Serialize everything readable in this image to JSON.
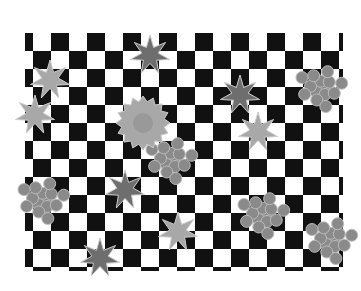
{
  "image": {
    "description": "Grayscale photo of a fabric swatch with black-and-white checkerboard pattern overlaid with maple leaves, chrysanthemums and grape-cluster flowers",
    "colors": {
      "background": "#ffffff",
      "check_dark": "#111111",
      "motif_light": "#a8a8a8",
      "motif_mid": "#8a8a8a",
      "motif_dark": "#6e6e6e"
    },
    "motifs": {
      "maple_leaves": [
        [
          50,
          80
        ],
        [
          150,
          55
        ],
        [
          35,
          115
        ],
        [
          240,
          95
        ],
        [
          258,
          132
        ],
        [
          125,
          190
        ],
        [
          178,
          232
        ],
        [
          100,
          258
        ]
      ],
      "chrysanthemum": [
        [
          143,
          123
        ]
      ],
      "grape_clusters": [
        [
          170,
          160
        ],
        [
          42,
          200
        ],
        [
          262,
          215
        ],
        [
          320,
          88
        ],
        [
          330,
          240
        ]
      ]
    }
  }
}
